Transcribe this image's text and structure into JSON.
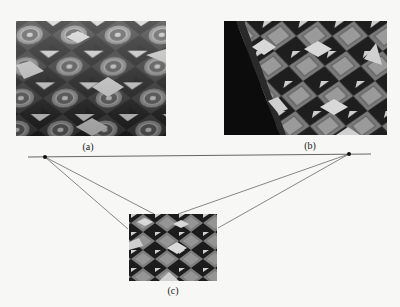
{
  "figure": {
    "panels": [
      {
        "id": "a",
        "label": "(a)",
        "description": "tiled floor photograph, view 1",
        "x": 16,
        "y": 21,
        "w": 150,
        "h": 115
      },
      {
        "id": "b",
        "label": "(b)",
        "description": "tiled floor photograph, view 2 (rotated perspective)",
        "x": 224,
        "y": 21,
        "w": 163,
        "h": 114
      },
      {
        "id": "c",
        "label": "(c)",
        "description": "tiled floor photograph, rectified view",
        "x": 129,
        "y": 214,
        "w": 88,
        "h": 67
      }
    ],
    "horizon_line": {
      "x1": 28,
      "y1": 157,
      "x2": 371,
      "y2": 154,
      "color": "#555555"
    },
    "vanishing_points": [
      {
        "name": "left",
        "x": 45,
        "y": 157
      },
      {
        "name": "right",
        "x": 349,
        "y": 154
      }
    ],
    "construction_lines": [
      {
        "from": "left",
        "x2": 128,
        "y2": 229
      },
      {
        "from": "left",
        "x2": 154,
        "y2": 214
      },
      {
        "from": "right",
        "x2": 178,
        "y2": 214
      },
      {
        "from": "right",
        "x2": 218,
        "y2": 228
      }
    ],
    "colors": {
      "background": "#f7f7f5",
      "tile_dark": "#1c1c1c",
      "tile_mid": "#6a6a6a",
      "tile_light": "#d8d8d8",
      "line": "#555555",
      "point": "#111111"
    }
  }
}
